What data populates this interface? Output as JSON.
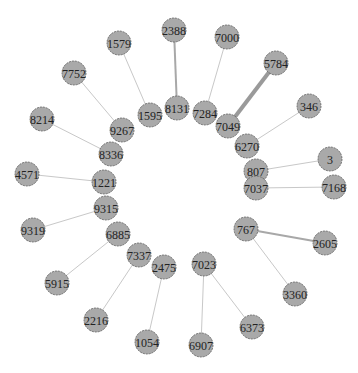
{
  "graph": {
    "node_color": "#a9a9a9",
    "node_border_color": "#5a5a5a",
    "edge_color": "#c8c8c8",
    "node_radius": 12,
    "nodes": [
      {
        "id": "2388",
        "x": 174,
        "y": 30
      },
      {
        "id": "8131",
        "x": 177,
        "y": 108
      },
      {
        "id": "1579",
        "x": 119,
        "y": 43
      },
      {
        "id": "1595",
        "x": 150,
        "y": 115
      },
      {
        "id": "7000",
        "x": 227,
        "y": 37
      },
      {
        "id": "7284",
        "x": 205,
        "y": 113
      },
      {
        "id": "5784",
        "x": 276,
        "y": 63
      },
      {
        "id": "7049",
        "x": 228,
        "y": 126
      },
      {
        "id": "346",
        "x": 309,
        "y": 106
      },
      {
        "id": "6270",
        "x": 247,
        "y": 146
      },
      {
        "id": "7752",
        "x": 74,
        "y": 73
      },
      {
        "id": "9267",
        "x": 122,
        "y": 130
      },
      {
        "id": "8214",
        "x": 42,
        "y": 119
      },
      {
        "id": "8336",
        "x": 111,
        "y": 154
      },
      {
        "id": "4571",
        "x": 27,
        "y": 174
      },
      {
        "id": "1221",
        "x": 104,
        "y": 182
      },
      {
        "id": "3",
        "x": 330,
        "y": 159
      },
      {
        "id": "807",
        "x": 256,
        "y": 171
      },
      {
        "id": "7168",
        "x": 334,
        "y": 187
      },
      {
        "id": "7037",
        "x": 256,
        "y": 188
      },
      {
        "id": "9319",
        "x": 33,
        "y": 230
      },
      {
        "id": "9315",
        "x": 106,
        "y": 208
      },
      {
        "id": "6885",
        "x": 118,
        "y": 234
      },
      {
        "id": "5915",
        "x": 57,
        "y": 283
      },
      {
        "id": "7337",
        "x": 139,
        "y": 255
      },
      {
        "id": "2216",
        "x": 96,
        "y": 320
      },
      {
        "id": "2475",
        "x": 164,
        "y": 267
      },
      {
        "id": "1054",
        "x": 147,
        "y": 342
      },
      {
        "id": "7023",
        "x": 204,
        "y": 264
      },
      {
        "id": "6907",
        "x": 201,
        "y": 345
      },
      {
        "id": "6373",
        "x": 252,
        "y": 327
      },
      {
        "id": "767",
        "x": 246,
        "y": 229
      },
      {
        "id": "2605",
        "x": 325,
        "y": 243
      },
      {
        "id": "3360",
        "x": 295,
        "y": 294
      }
    ],
    "edges": [
      {
        "source": "2388",
        "target": "8131",
        "weight": "medium"
      },
      {
        "source": "1579",
        "target": "1595",
        "weight": "light"
      },
      {
        "source": "7000",
        "target": "7284",
        "weight": "light"
      },
      {
        "source": "5784",
        "target": "7049",
        "weight": "heavy"
      },
      {
        "source": "346",
        "target": "6270",
        "weight": "light"
      },
      {
        "source": "7752",
        "target": "9267",
        "weight": "light"
      },
      {
        "source": "8214",
        "target": "8336",
        "weight": "light"
      },
      {
        "source": "4571",
        "target": "1221",
        "weight": "light"
      },
      {
        "source": "3",
        "target": "807",
        "weight": "light"
      },
      {
        "source": "7168",
        "target": "7037",
        "weight": "light"
      },
      {
        "source": "9319",
        "target": "9315",
        "weight": "light"
      },
      {
        "source": "6885",
        "target": "5915",
        "weight": "light"
      },
      {
        "source": "7337",
        "target": "2216",
        "weight": "light"
      },
      {
        "source": "2475",
        "target": "1054",
        "weight": "light"
      },
      {
        "source": "7023",
        "target": "6907",
        "weight": "light"
      },
      {
        "source": "7023",
        "target": "6373",
        "weight": "light"
      },
      {
        "source": "767",
        "target": "2605",
        "weight": "medium"
      },
      {
        "source": "767",
        "target": "3360",
        "weight": "light"
      }
    ]
  }
}
